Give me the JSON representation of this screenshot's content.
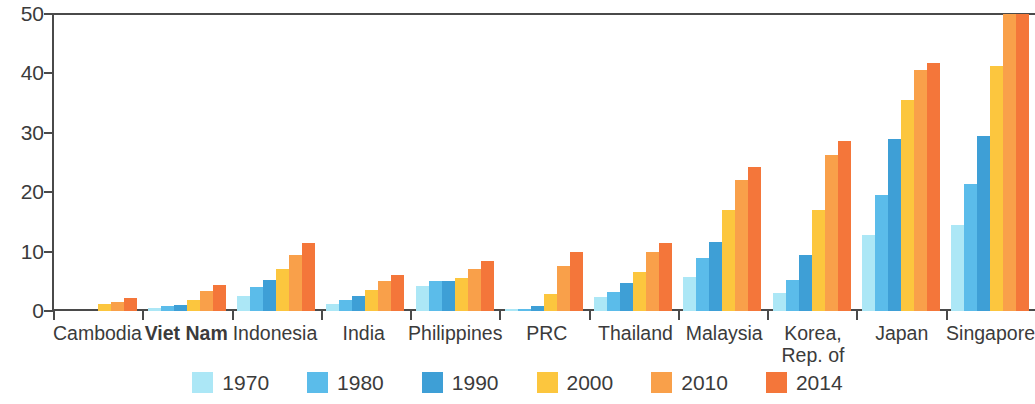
{
  "chart_data": {
    "type": "bar",
    "title": "",
    "subtitle": "",
    "xlabel": "",
    "ylabel": "",
    "ylim": [
      0,
      50
    ],
    "yticks": [
      0,
      10,
      20,
      30,
      40,
      50
    ],
    "grid": false,
    "legend_position": "bottom",
    "categories": [
      "Cambodia",
      "Viet Nam",
      "Indonesia",
      "India",
      "Philippines",
      "PRC",
      "Thailand",
      "Malaysia",
      "Korea,\nRep. of",
      "Japan",
      "Singapore"
    ],
    "category_styles": [
      "normal",
      "bold",
      "normal",
      "normal",
      "normal",
      "normal",
      "normal",
      "normal",
      "normal",
      "normal",
      "normal"
    ],
    "series": [
      {
        "name": "1970",
        "color": "#ACE7F6",
        "values": [
          0.0,
          0.5,
          2.5,
          1.2,
          4.2,
          0.3,
          2.3,
          5.7,
          3.0,
          12.8,
          14.5
        ]
      },
      {
        "name": "1980",
        "color": "#5BBCEA",
        "values": [
          0.0,
          0.8,
          4.0,
          1.9,
          5.0,
          0.4,
          3.2,
          9.0,
          5.2,
          19.5,
          21.3
        ]
      },
      {
        "name": "1990",
        "color": "#3E9FD6",
        "values": [
          0.0,
          1.0,
          5.3,
          2.5,
          5.0,
          0.8,
          4.7,
          11.7,
          9.5,
          29.0,
          29.5
        ]
      },
      {
        "name": "2000",
        "color": "#FCC63E",
        "values": [
          1.1,
          1.9,
          7.0,
          3.5,
          5.5,
          2.8,
          6.6,
          17.0,
          17.0,
          35.5,
          41.3
        ]
      },
      {
        "name": "2010",
        "color": "#F9A04A",
        "values": [
          1.5,
          3.3,
          9.5,
          5.0,
          7.0,
          7.5,
          10.0,
          22.0,
          26.3,
          40.5,
          53.0
        ]
      },
      {
        "name": "2014",
        "color": "#F4763A",
        "values": [
          2.2,
          4.3,
          11.5,
          6.0,
          8.5,
          10.0,
          11.5,
          24.3,
          28.7,
          41.8,
          56.0
        ]
      }
    ]
  }
}
